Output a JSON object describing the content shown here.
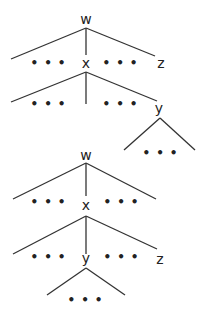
{
  "diagram": {
    "type": "syntax-tree-comparison",
    "line_color": "#333333",
    "ellipsis": "•••",
    "trees": [
      {
        "name": "tree-top",
        "root": "w",
        "nodes": {
          "root": "w",
          "mid": "x",
          "right": "z",
          "deep": "y"
        },
        "structure": "w dominates [... x ... z]; x dominates [... ... y]; y dominates [...]"
      },
      {
        "name": "tree-bottom",
        "root": "w",
        "nodes": {
          "root": "w",
          "mid": "x",
          "deep": "y",
          "right": "z"
        },
        "structure": "w dominates [... x ...]; x dominates [... y ... z]; y dominates [...]"
      }
    ]
  }
}
